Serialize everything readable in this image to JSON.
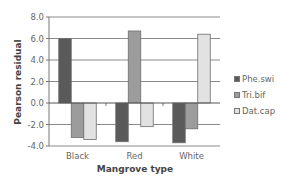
{
  "chart_data": {
    "type": "bar",
    "title": "",
    "xlabel": "Mangrove type",
    "ylabel": "Pearson residual",
    "categories": [
      "Black",
      "Red",
      "White"
    ],
    "series": [
      {
        "name": "Phe.swi",
        "color": "#5a5a5a",
        "values": [
          6.0,
          -3.6,
          -3.7
        ]
      },
      {
        "name": "Tri.bif",
        "color": "#9c9c9c",
        "values": [
          -3.2,
          6.7,
          -2.4
        ]
      },
      {
        "name": "Dat.cap",
        "color": "#e2e2e2",
        "values": [
          -3.4,
          -2.2,
          6.4
        ]
      }
    ],
    "ylim": [
      -4.0,
      8.0
    ],
    "yticks": [
      "8.0",
      "6.0",
      "4.0",
      "2.0",
      "0.0",
      "-2.0",
      "-4.0"
    ],
    "ytick_values": [
      8,
      6,
      4,
      2,
      0,
      -2,
      -4
    ],
    "grid": true,
    "legend_position": "right"
  }
}
